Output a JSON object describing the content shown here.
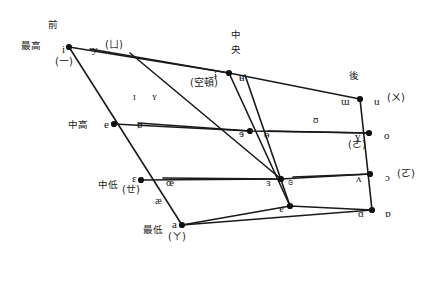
{
  "diagram": {
    "type": "vowel-trapezoid",
    "stroke_color": "#1a1a1a",
    "dot_color": "#111111"
  },
  "axis_labels": {
    "front": "前",
    "central_line1": "中",
    "central_line2": "央",
    "back": "後",
    "close": "最高",
    "close_mid": "中高",
    "open_mid": "中低",
    "open": "最低"
  },
  "vowels": [
    {
      "id": "i",
      "symbol": "i",
      "x": 62,
      "y": 44,
      "side": "left",
      "dot_x": 69,
      "dot_y": 47
    },
    {
      "id": "y",
      "symbol": "y",
      "x": 92,
      "y": 44,
      "side": "right",
      "dot_x": null,
      "dot_y": null
    },
    {
      "id": "barred-i",
      "symbol": "ɨ",
      "x": 214,
      "y": 70,
      "side": "left",
      "dot_x": 229,
      "dot_y": 73
    },
    {
      "id": "barred-u",
      "symbol": "ʉ",
      "x": 239,
      "y": 72,
      "side": "right",
      "dot_x": null,
      "dot_y": null
    },
    {
      "id": "turned-m",
      "symbol": "ɯ",
      "x": 341,
      "y": 96,
      "side": "left",
      "dot_x": 360,
      "dot_y": 99
    },
    {
      "id": "u",
      "symbol": "u",
      "x": 374,
      "y": 96,
      "side": "right",
      "dot_x": null,
      "dot_y": null
    },
    {
      "id": "small-cap-i",
      "symbol": "ɪ",
      "x": 133,
      "y": 92,
      "side": "interior",
      "dot_x": null,
      "dot_y": null
    },
    {
      "id": "small-cap-y",
      "symbol": "ʏ",
      "x": 152,
      "y": 92,
      "side": "interior",
      "dot_x": null,
      "dot_y": null
    },
    {
      "id": "upsilon",
      "symbol": "ʊ",
      "x": 313,
      "y": 115,
      "side": "interior",
      "dot_x": null,
      "dot_y": null
    },
    {
      "id": "e",
      "symbol": "e",
      "x": 104,
      "y": 119,
      "side": "left",
      "dot_x": 114,
      "dot_y": 124
    },
    {
      "id": "o-slash",
      "symbol": "ø",
      "x": 137,
      "y": 119,
      "side": "right",
      "dot_x": null,
      "dot_y": null
    },
    {
      "id": "schwa-rev",
      "symbol": "ɘ",
      "x": 239,
      "y": 128,
      "side": "left",
      "dot_x": 250,
      "dot_y": 131
    },
    {
      "id": "barred-o",
      "symbol": "ɵ",
      "x": 264,
      "y": 129,
      "side": "right",
      "dot_x": null,
      "dot_y": null
    },
    {
      "id": "rams-horn",
      "symbol": "ɣ",
      "x": 355,
      "y": 131,
      "side": "left",
      "dot_x": 369,
      "dot_y": 133
    },
    {
      "id": "o",
      "symbol": "o",
      "x": 384,
      "y": 130,
      "side": "right",
      "dot_x": null,
      "dot_y": null
    },
    {
      "id": "open-e",
      "symbol": "ɛ",
      "x": 132,
      "y": 173,
      "side": "left",
      "dot_x": 141,
      "dot_y": 180
    },
    {
      "id": "oe-lig",
      "symbol": "œ",
      "x": 166,
      "y": 177,
      "side": "right",
      "dot_x": null,
      "dot_y": null
    },
    {
      "id": "rev-open-e",
      "symbol": "ɜ",
      "x": 266,
      "y": 177,
      "side": "left",
      "dot_x": 281,
      "dot_y": 179
    },
    {
      "id": "closed-open-e",
      "symbol": "ɞ",
      "x": 288,
      "y": 176,
      "side": "right",
      "dot_x": null,
      "dot_y": null
    },
    {
      "id": "turned-v",
      "symbol": "ʌ",
      "x": 356,
      "y": 173,
      "side": "left",
      "dot_x": 370,
      "dot_y": 174
    },
    {
      "id": "open-o",
      "symbol": "ɔ",
      "x": 385,
      "y": 172,
      "side": "right",
      "dot_x": null,
      "dot_y": null
    },
    {
      "id": "ae-lig",
      "symbol": "æ",
      "x": 155,
      "y": 196,
      "side": "interior",
      "dot_x": null,
      "dot_y": null
    },
    {
      "id": "turned-a",
      "symbol": "ɐ",
      "x": 279,
      "y": 203,
      "side": "left",
      "dot_x": 290,
      "dot_y": 206
    },
    {
      "id": "a",
      "symbol": "a",
      "x": 172,
      "y": 219,
      "side": "left",
      "dot_x": 182,
      "dot_y": 225
    },
    {
      "id": "script-a",
      "symbol": "ɑ",
      "x": 358,
      "y": 208,
      "side": "left",
      "dot_x": 372,
      "dot_y": 210
    },
    {
      "id": "turned-script-a",
      "symbol": "ɒ",
      "x": 385,
      "y": 208,
      "side": "right",
      "dot_x": null,
      "dot_y": null
    }
  ],
  "bopomofo_annotations": [
    {
      "id": "ann-i",
      "text": "(一)",
      "x": 55,
      "y": 57
    },
    {
      "id": "ann-y",
      "text": "(ㄩ)",
      "x": 105,
      "y": 40
    },
    {
      "id": "ann-ii",
      "text": "(空頓)",
      "x": 190,
      "y": 78
    },
    {
      "id": "ann-u",
      "text": "(ㄨ)",
      "x": 387,
      "y": 93
    },
    {
      "id": "ann-o",
      "text": "(ㄜ)",
      "x": 348,
      "y": 140
    },
    {
      "id": "ann-oo",
      "text": "(ㄛ)",
      "x": 397,
      "y": 169
    },
    {
      "id": "ann-e",
      "text": "(ㄝ)",
      "x": 122,
      "y": 185
    },
    {
      "id": "ann-a",
      "text": "(ㄚ)",
      "x": 168,
      "y": 232
    }
  ],
  "lines": [
    {
      "id": "close-line",
      "d": "M 69,47 L 229,73 L 360,99"
    },
    {
      "id": "close-mid-line",
      "d": "M 114,124 L 250,131 L 369,133"
    },
    {
      "id": "open-mid-line",
      "d": "M 141,180 L 281,179 L 370,174"
    },
    {
      "id": "open-line",
      "d": "M 182,225 L 290,206 L 372,210"
    },
    {
      "id": "front-edge",
      "d": "M 69,47 L 182,225"
    },
    {
      "id": "central-edge",
      "d": "M 229,73 L 290,206"
    },
    {
      "id": "back-edge",
      "d": "M 360,99 L 372,210"
    },
    {
      "id": "front-inner-a",
      "d": "M 90,49 L 229,73"
    },
    {
      "id": "front-inner-b",
      "d": "M 130,53 L 281,179"
    },
    {
      "id": "central-inner",
      "d": "M 245,75 L 290,206"
    },
    {
      "id": "mid-inner",
      "d": "M 138,123 L 250,131"
    },
    {
      "id": "low-inner",
      "d": "M 163,178 L 281,179"
    },
    {
      "id": "bot-inner",
      "d": "M 293,177 L 370,174"
    },
    {
      "id": "back-inner",
      "d": "M 268,131 L 369,133"
    },
    {
      "id": "open-inner",
      "d": "M 182,225 L 372,210"
    }
  ]
}
